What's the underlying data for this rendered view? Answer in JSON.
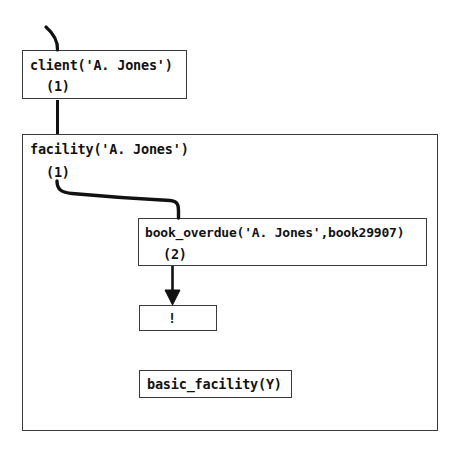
{
  "diagram": {
    "nodes": [
      {
        "id": "client",
        "goal": "client('A. Jones')",
        "index": "(1)"
      },
      {
        "id": "facility",
        "goal": "facility('A. Jones')",
        "index": "(1)"
      },
      {
        "id": "book_overdue",
        "goal": "book_overdue('A. Jones',book29907)",
        "index": "(2)"
      },
      {
        "id": "cut",
        "goal": "!"
      },
      {
        "id": "basic_facility",
        "goal": "basic_facility(Y)"
      }
    ],
    "colors": {
      "stroke": "#3a3a3a",
      "arrow": "#111111",
      "text": "#121212",
      "background": "#ffffff"
    }
  }
}
